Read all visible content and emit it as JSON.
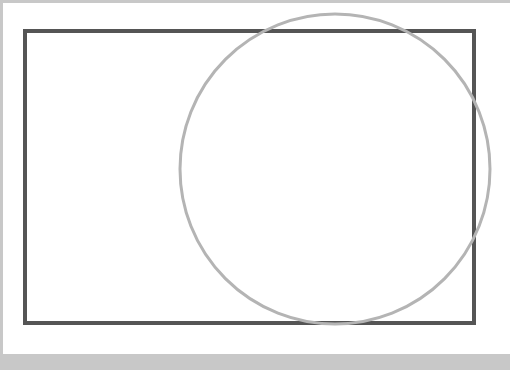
{
  "diagram": {
    "background": "#ffffff",
    "frame_color": "#c8c8c8",
    "shapes": [
      {
        "type": "rectangle",
        "x": 25,
        "y": 31,
        "width": 449,
        "height": 292,
        "stroke": "#555555",
        "stroke_width": 4
      },
      {
        "type": "circle",
        "cx": 335,
        "cy": 169,
        "r": 155,
        "stroke": "#b4b4b4",
        "stroke_width": 3
      }
    ]
  }
}
